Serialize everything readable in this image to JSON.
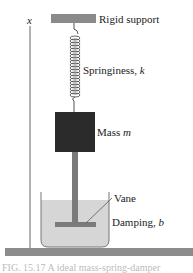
{
  "diagram": {
    "axis_label": "x",
    "labels": {
      "support": "Rigid support",
      "spring": "Springiness, ",
      "spring_var": "k",
      "mass": "Mass ",
      "mass_var": "m",
      "vane": "Vane",
      "damping": "Damping, ",
      "damping_var": "b"
    },
    "caption": "FIG. 15.17 A ideal mass-spring-damper",
    "colors": {
      "support": "#8a8a8a",
      "mass": "#2b2b2b",
      "rod": "#7a7a7a",
      "fluid": "#d6d6d6",
      "ground": "#8c8c8c",
      "line": "#555555"
    }
  }
}
